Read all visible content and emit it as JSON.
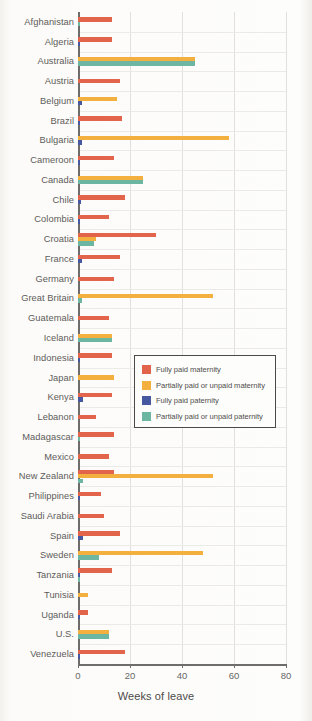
{
  "chart_data": {
    "type": "bar",
    "orientation": "horizontal",
    "title": "",
    "xlabel": "Weeks of leave",
    "ylabel": "",
    "xlim": [
      0,
      80
    ],
    "xticks": [
      0,
      20,
      40,
      60,
      80
    ],
    "grid": true,
    "legend_position": "center-right",
    "series": [
      {
        "name": "Fully paid maternity",
        "color": "#E2654B"
      },
      {
        "name": "Partially paid or unpaid maternity",
        "color": "#F3B03F"
      },
      {
        "name": "Fully paid paternity",
        "color": "#4558A0"
      },
      {
        "name": "Partially paid or unpaid paternity",
        "color": "#6CB6A2"
      }
    ],
    "categories": [
      "Afghanistan",
      "Algeria",
      "Australia",
      "Austria",
      "Belgium",
      "Brazil",
      "Bulgaria",
      "Cameroon",
      "Canada",
      "Chile",
      "Colombia",
      "Croatia",
      "France",
      "Germany",
      "Great Britain",
      "Guatemala",
      "Iceland",
      "Indonesia",
      "Japan",
      "Kenya",
      "Lebanon",
      "Madagascar",
      "Mexico",
      "New Zealand",
      "Philippines",
      "Saudi Arabia",
      "Spain",
      "Sweden",
      "Tanzania",
      "Tunisia",
      "Uganda",
      "U.S.",
      "Venezuela"
    ],
    "values": {
      "Fully paid maternity": [
        13,
        13,
        0,
        16,
        0,
        17,
        0,
        14,
        0,
        18,
        12,
        30,
        16,
        14,
        0,
        12,
        0,
        13,
        0,
        13,
        7,
        14,
        12,
        14,
        9,
        10,
        16,
        0,
        13,
        0,
        4,
        0,
        18
      ],
      "Partially paid or unpaid maternity": [
        0,
        0,
        45,
        0,
        15,
        0,
        58,
        0,
        25,
        0,
        0,
        7,
        0,
        0,
        52,
        0,
        13,
        0,
        14,
        0,
        0,
        0,
        0,
        52,
        0,
        0,
        0,
        48,
        0,
        4,
        0,
        12,
        0
      ],
      "Fully paid paternity": [
        0,
        0.5,
        0,
        0,
        1.5,
        0.6,
        1.5,
        0.6,
        0,
        1,
        0.8,
        0,
        1.5,
        0,
        0,
        0,
        0,
        0.5,
        0,
        2,
        0,
        0,
        0,
        0,
        0.6,
        0,
        2,
        0,
        0.4,
        0,
        0.8,
        0,
        0.5
      ],
      "Partially paid or unpaid paternity": [
        0.8,
        0,
        45,
        0,
        0,
        0,
        0,
        0,
        25,
        0,
        0,
        6,
        0,
        0,
        1.5,
        0,
        13,
        0,
        0,
        0,
        0,
        0.8,
        0,
        2,
        0,
        0,
        0,
        8,
        0.6,
        0,
        0,
        12,
        0
      ]
    }
  },
  "legend": {
    "items": [
      {
        "label": "Fully paid maternity",
        "color": "#E2654B"
      },
      {
        "label": "Partially paid or unpaid maternity",
        "color": "#F3B03F"
      },
      {
        "label": "Fully paid paternity",
        "color": "#4558A0"
      },
      {
        "label": "Partially paid or unpaid paternity",
        "color": "#6CB6A2"
      }
    ]
  },
  "axis": {
    "x_title": "Weeks of leave",
    "x_tick_labels": [
      "0",
      "20",
      "40",
      "60",
      "80"
    ]
  }
}
